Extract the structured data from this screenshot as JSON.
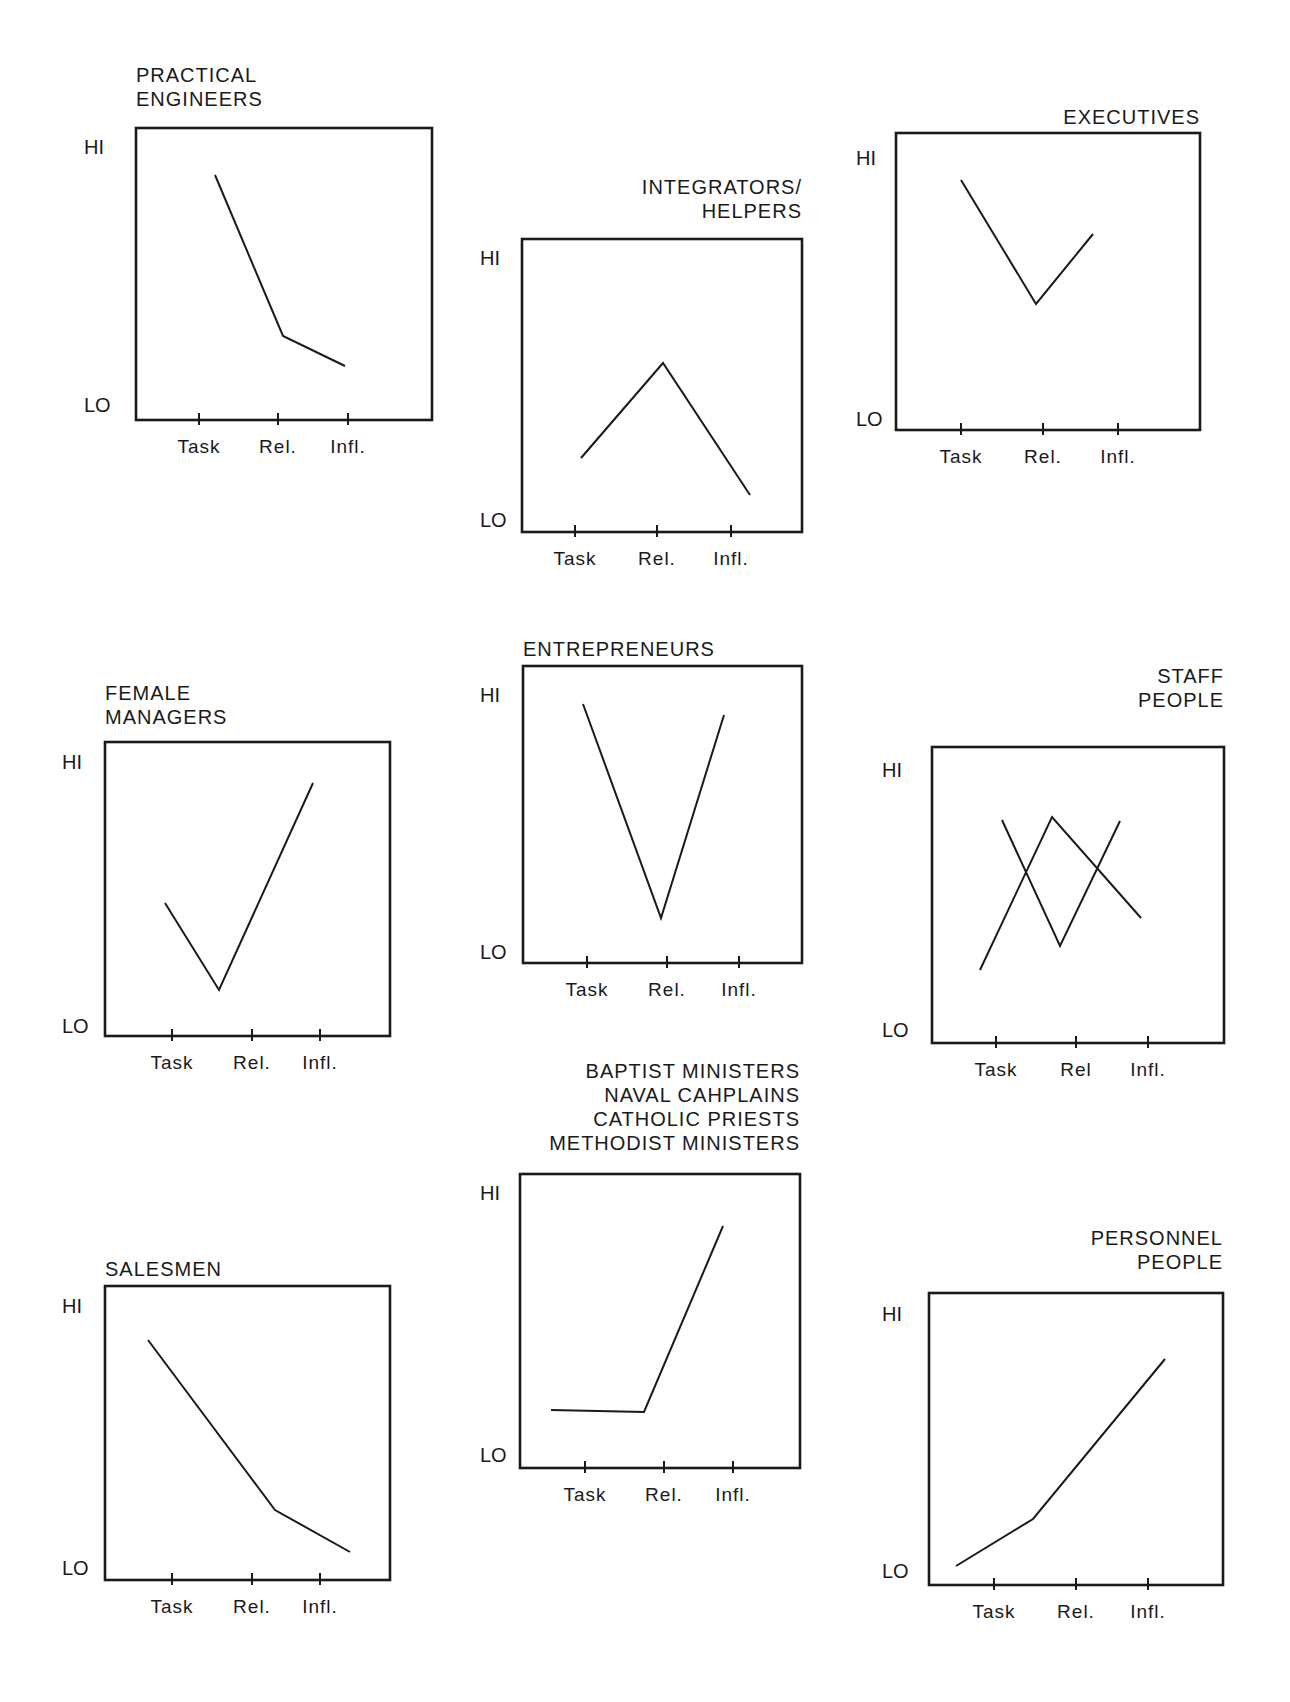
{
  "chart_data": [
    {
      "type": "line",
      "title": "PRACTICAL ENGINEERS",
      "title_lines": [
        "PRACTICAL",
        "ENGINEERS"
      ],
      "title_align": "left",
      "categories": [
        "Task",
        "Rel.",
        "Infl."
      ],
      "ylabels": {
        "hi": "HI",
        "lo": "LO"
      },
      "series": [
        {
          "name": "profile",
          "values": [
            0.85,
            0.27,
            0.15
          ]
        }
      ],
      "box": [
        136,
        128,
        432,
        420
      ],
      "ticks_x": [
        199,
        278,
        348
      ],
      "points": [
        [
          [
            215,
            175
          ],
          [
            283,
            336
          ],
          [
            345,
            366
          ]
        ]
      ],
      "title_pos": [
        136,
        82
      ],
      "hi_y": 147,
      "lo_y": 405,
      "label_x": 84
    },
    {
      "type": "line",
      "title": "INTEGRATORS/ HELPERS",
      "title_lines": [
        "INTEGRATORS/",
        "HELPERS"
      ],
      "title_align": "right",
      "categories": [
        "Task",
        "Rel.",
        "Infl."
      ],
      "ylabels": {
        "hi": "HI",
        "lo": "LO"
      },
      "series": [
        {
          "name": "profile",
          "values": [
            0.27,
            0.6,
            0.14
          ]
        }
      ],
      "box": [
        522,
        239,
        802,
        532
      ],
      "ticks_x": [
        575,
        657,
        731
      ],
      "points": [
        [
          [
            581,
            458
          ],
          [
            663,
            363
          ],
          [
            750,
            495
          ]
        ]
      ],
      "title_pos": [
        802,
        194
      ],
      "hi_y": 258,
      "lo_y": 520,
      "label_x": 480
    },
    {
      "type": "line",
      "title": "EXECUTIVES",
      "title_lines": [
        "EXECUTIVES"
      ],
      "title_align": "right",
      "categories": [
        "Task",
        "Rel.",
        "Infl."
      ],
      "ylabels": {
        "hi": "HI",
        "lo": "LO"
      },
      "series": [
        {
          "name": "profile",
          "values": [
            0.88,
            0.47,
            0.7
          ]
        }
      ],
      "box": [
        896,
        133,
        1200,
        430
      ],
      "ticks_x": [
        961,
        1043,
        1118
      ],
      "points": [
        [
          [
            961,
            180
          ],
          [
            1036,
            304
          ],
          [
            1093,
            234
          ]
        ]
      ],
      "title_pos": [
        1200,
        124
      ],
      "hi_y": 158,
      "lo_y": 419,
      "label_x": 856
    },
    {
      "type": "line",
      "title": "FEMALE MANAGERS",
      "title_lines": [
        "FEMALE",
        "MANAGERS"
      ],
      "title_align": "left",
      "categories": [
        "Task",
        "Rel.",
        "Infl."
      ],
      "ylabels": {
        "hi": "HI",
        "lo": "LO"
      },
      "series": [
        {
          "name": "profile",
          "values": [
            0.46,
            0.17,
            0.87
          ]
        }
      ],
      "box": [
        105,
        742,
        390,
        1036
      ],
      "ticks_x": [
        172,
        252,
        320
      ],
      "points": [
        [
          [
            165,
            903
          ],
          [
            219,
            990
          ],
          [
            313,
            783
          ]
        ]
      ],
      "title_pos": [
        105,
        700
      ],
      "hi_y": 762,
      "lo_y": 1026,
      "label_x": 62
    },
    {
      "type": "line",
      "title": "ENTREPRENEURS",
      "title_lines": [
        "ENTREPRENEURS"
      ],
      "title_align": "left",
      "categories": [
        "Task",
        "Rel.",
        "Infl."
      ],
      "ylabels": {
        "hi": "HI",
        "lo": "LO"
      },
      "series": [
        {
          "name": "profile",
          "values": [
            0.9,
            0.18,
            0.86
          ]
        }
      ],
      "box": [
        523,
        666,
        802,
        963
      ],
      "ticks_x": [
        587,
        667,
        739
      ],
      "points": [
        [
          [
            583,
            704
          ],
          [
            661,
            918
          ],
          [
            724,
            715
          ]
        ]
      ],
      "title_pos": [
        523,
        656
      ],
      "hi_y": 695,
      "lo_y": 952,
      "label_x": 480
    },
    {
      "type": "line",
      "title": "STAFF PEOPLE",
      "title_lines": [
        "STAFF",
        "PEOPLE"
      ],
      "title_align": "right",
      "categories": [
        "Task",
        "Rel",
        "Infl."
      ],
      "ylabels": {
        "hi": "HI",
        "lo": "LO"
      },
      "series": [
        {
          "name": "line-a",
          "values": [
            0.75,
            0.33,
            0.75
          ]
        },
        {
          "name": "line-b",
          "values": [
            0.25,
            0.76,
            0.42
          ]
        }
      ],
      "box": [
        932,
        747,
        1224,
        1043
      ],
      "ticks_x": [
        996,
        1076,
        1148
      ],
      "points": [
        [
          [
            1002,
            820
          ],
          [
            1060,
            946
          ],
          [
            1120,
            821
          ]
        ],
        [
          [
            980,
            970
          ],
          [
            1052,
            817
          ],
          [
            1141,
            918
          ]
        ]
      ],
      "title_pos": [
        1224,
        683
      ],
      "hi_y": 770,
      "lo_y": 1030,
      "label_x": 882
    },
    {
      "type": "line",
      "title": "SALESMEN",
      "title_lines": [
        "SALESMEN"
      ],
      "title_align": "left",
      "categories": [
        "Task",
        "Rel.",
        "Infl."
      ],
      "ylabels": {
        "hi": "HI",
        "lo": "LO"
      },
      "series": [
        {
          "name": "profile",
          "values": [
            0.82,
            0.24,
            0.1
          ]
        }
      ],
      "box": [
        105,
        1286,
        390,
        1580
      ],
      "ticks_x": [
        172,
        252,
        320
      ],
      "points": [
        [
          [
            148,
            1340
          ],
          [
            275,
            1510
          ],
          [
            350,
            1552
          ]
        ]
      ],
      "title_pos": [
        105,
        1276
      ],
      "hi_y": 1306,
      "lo_y": 1568,
      "label_x": 62
    },
    {
      "type": "line",
      "title": "BAPTIST MINISTERS NAVAL CAHPLAINS CATHOLIC PRIESTS METHODIST MINISTERS",
      "title_lines": [
        "BAPTIST MINISTERS",
        "NAVAL CAHPLAINS",
        "CATHOLIC PRIESTS",
        "METHODIST MINISTERS"
      ],
      "title_align": "right",
      "categories": [
        "Task",
        "Rel.",
        "Infl."
      ],
      "ylabels": {
        "hi": "HI",
        "lo": "LO"
      },
      "series": [
        {
          "name": "profile",
          "values": [
            0.2,
            0.19,
            0.82
          ]
        }
      ],
      "box": [
        520,
        1174,
        800,
        1468
      ],
      "ticks_x": [
        585,
        664,
        733
      ],
      "points": [
        [
          [
            551,
            1410
          ],
          [
            644,
            1412
          ],
          [
            723,
            1226
          ]
        ]
      ],
      "title_pos": [
        800,
        1078
      ],
      "hi_y": 1193,
      "lo_y": 1455,
      "label_x": 480
    },
    {
      "type": "line",
      "title": "PERSONNEL PEOPLE",
      "title_lines": [
        "PERSONNEL",
        "PEOPLE"
      ],
      "title_align": "right",
      "categories": [
        "Task",
        "Rel.",
        "Infl."
      ],
      "ylabels": {
        "hi": "HI",
        "lo": "LO"
      },
      "series": [
        {
          "name": "profile",
          "values": [
            0.06,
            0.22,
            0.77
          ]
        }
      ],
      "box": [
        929,
        1293,
        1223,
        1585
      ],
      "ticks_x": [
        994,
        1076,
        1148
      ],
      "points": [
        [
          [
            956,
            1566
          ],
          [
            1033,
            1519
          ],
          [
            1165,
            1359
          ]
        ]
      ],
      "title_pos": [
        1223,
        1245
      ],
      "hi_y": 1314,
      "lo_y": 1571,
      "label_x": 882
    }
  ]
}
